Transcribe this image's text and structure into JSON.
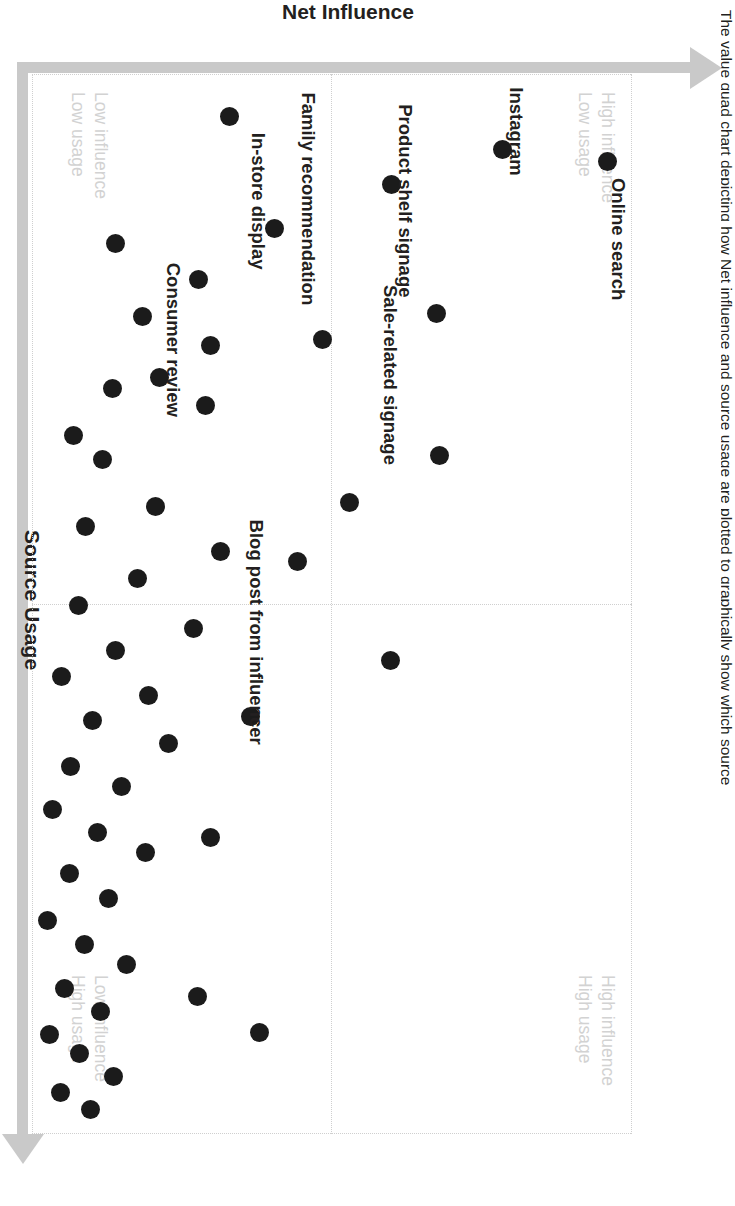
{
  "caption": "The value quad chart depicting how Net influence and source usage are plotted to graphically show which source",
  "axes": {
    "x_title": "Source Usage",
    "y_title": "Net Influence"
  },
  "quadrants": [
    {
      "id": "high-influence-low-usage",
      "line1": "High influence",
      "line2": "Low usage"
    },
    {
      "id": "high-influence-high-usage",
      "line1": "High influence",
      "line2": "High usage"
    },
    {
      "id": "low-influence-low-usage",
      "line1": "Low influence",
      "line2": "Low usage"
    },
    {
      "id": "low-influence-high-usage",
      "line1": "Low influence",
      "line2": "High usage"
    }
  ],
  "colors": {
    "dot": "#1b1b1b",
    "axis": "#c9c9c9",
    "grid": "#cfcfcf",
    "quadrant_label": "#d2d2d2",
    "text": "#231f20"
  },
  "chart_data": {
    "type": "scatter",
    "title": "The value quad chart depicting how Net influence and source usage are plotted to graphically show which source",
    "xlabel": "Source Usage",
    "ylabel": "Net Influence",
    "xlim": [
      0,
      100
    ],
    "ylim": [
      0,
      100
    ],
    "grid": true,
    "gridlines": {
      "x": [
        50
      ],
      "y": [
        50
      ]
    },
    "legend": "none",
    "quadrant_annotations": [
      {
        "position": "top-left",
        "text": "High influence / Low usage"
      },
      {
        "position": "top-right",
        "text": "High influence / High usage"
      },
      {
        "position": "bottom-left",
        "text": "Low influence / Low usage"
      },
      {
        "position": "bottom-right",
        "text": "Low influence / High usage"
      }
    ],
    "labeled_points": [
      {
        "label": "Online search",
        "x": 89,
        "y": 88
      },
      {
        "label": "Instagram",
        "x": 82,
        "y": 69
      },
      {
        "label": "Product shelf signage",
        "x": 78,
        "y": 60
      },
      {
        "label": "Sale-related signage",
        "x": 79,
        "y": 27
      },
      {
        "label": "Family recommendation",
        "x": 60,
        "y": 92
      },
      {
        "label": "In-store display",
        "x": 61,
        "y": 66
      },
      {
        "label": "Consumer review",
        "x": 50,
        "y": 37
      },
      {
        "label": "Blog post from influencer",
        "x": 21,
        "y": 47
      }
    ],
    "points": [
      {
        "x": 89,
        "y": 88
      },
      {
        "x": 82,
        "y": 69
      },
      {
        "x": 78,
        "y": 60
      },
      {
        "x": 79,
        "y": 27
      },
      {
        "x": 60,
        "y": 92
      },
      {
        "x": 61,
        "y": 66
      },
      {
        "x": 68,
        "y": 39
      },
      {
        "x": 50,
        "y": 37
      },
      {
        "x": 54,
        "y": 19
      },
      {
        "x": 51,
        "y": 52
      },
      {
        "x": 56,
        "y": 50
      },
      {
        "x": 46,
        "y": 43
      },
      {
        "x": 45,
        "y": 51
      },
      {
        "x": 44,
        "y": 56
      },
      {
        "x": 40,
        "y": 38
      },
      {
        "x": 38,
        "y": 62
      },
      {
        "x": 36,
        "y": 45
      },
      {
        "x": 34,
        "y": 21
      },
      {
        "x": 32,
        "y": 36
      },
      {
        "x": 31,
        "y": 58
      },
      {
        "x": 29,
        "y": 16
      },
      {
        "x": 28,
        "y": 43
      },
      {
        "x": 26,
        "y": 27
      },
      {
        "x": 25,
        "y": 52
      },
      {
        "x": 24,
        "y": 32
      },
      {
        "x": 22,
        "y": 21
      },
      {
        "x": 21,
        "y": 47
      },
      {
        "x": 19,
        "y": 37
      },
      {
        "x": 17,
        "y": 57
      },
      {
        "x": 16,
        "y": 28
      },
      {
        "x": 15,
        "y": 43
      },
      {
        "x": 14,
        "y": 12
      },
      {
        "x": 13,
        "y": 34
      },
      {
        "x": 12,
        "y": 48
      },
      {
        "x": 11,
        "y": 22
      },
      {
        "x": 10,
        "y": 40
      },
      {
        "x": 9,
        "y": 31
      },
      {
        "x": 9,
        "y": 36
      },
      {
        "x": 8,
        "y": 44
      },
      {
        "x": 7,
        "y": 26
      },
      {
        "x": 7,
        "y": 18
      },
      {
        "x": 6,
        "y": 33
      },
      {
        "x": 5,
        "y": 39
      },
      {
        "x": 5,
        "y": 29
      },
      {
        "x": 4,
        "y": 21
      },
      {
        "x": 4,
        "y": 35
      },
      {
        "x": 3,
        "y": 27
      },
      {
        "x": 3,
        "y": 31
      },
      {
        "x": 2,
        "y": 24
      },
      {
        "x": 2,
        "y": 37
      },
      {
        "x": 1,
        "y": 30
      },
      {
        "x": 1,
        "y": 14
      }
    ]
  },
  "rendered_dots": [
    {
      "l": 8.3,
      "t": 4.1
    },
    {
      "l": 7.1,
      "t": 21.6
    },
    {
      "l": 22.6,
      "t": 32.6
    },
    {
      "l": 10.4,
      "t": 40.0
    },
    {
      "l": 25.0,
      "t": 51.5
    },
    {
      "l": 4.0,
      "t": 67.1
    },
    {
      "l": 14.6,
      "t": 59.5
    },
    {
      "l": 19.4,
      "t": 72.2
    },
    {
      "l": 25.6,
      "t": 70.3
    },
    {
      "l": 31.3,
      "t": 71.0
    },
    {
      "l": 22.9,
      "t": 81.6
    },
    {
      "l": 28.6,
      "t": 78.8
    },
    {
      "l": 29.7,
      "t": 86.6
    },
    {
      "l": 16.0,
      "t": 86.0
    },
    {
      "l": 34.1,
      "t": 93.1
    },
    {
      "l": 36.4,
      "t": 88.3
    },
    {
      "l": 40.8,
      "t": 79.4
    },
    {
      "l": 42.7,
      "t": 91.0
    },
    {
      "l": 45.0,
      "t": 68.6
    },
    {
      "l": 47.6,
      "t": 82.4
    },
    {
      "l": 50.1,
      "t": 92.2
    },
    {
      "l": 52.3,
      "t": 73.0
    },
    {
      "l": 54.4,
      "t": 86.1
    },
    {
      "l": 56.8,
      "t": 95.1
    },
    {
      "l": 58.6,
      "t": 80.6
    },
    {
      "l": 61.0,
      "t": 89.9
    },
    {
      "l": 63.2,
      "t": 77.2
    },
    {
      "l": 65.3,
      "t": 93.6
    },
    {
      "l": 67.2,
      "t": 85.1
    },
    {
      "l": 69.4,
      "t": 96.5
    },
    {
      "l": 71.6,
      "t": 89.0
    },
    {
      "l": 73.4,
      "t": 81.1
    },
    {
      "l": 75.4,
      "t": 93.8
    },
    {
      "l": 77.8,
      "t": 87.3
    },
    {
      "l": 79.9,
      "t": 97.4
    },
    {
      "l": 82.1,
      "t": 91.3
    },
    {
      "l": 84.0,
      "t": 84.3
    },
    {
      "l": 86.3,
      "t": 94.5
    },
    {
      "l": 88.4,
      "t": 88.6
    },
    {
      "l": 90.6,
      "t": 97.0
    },
    {
      "l": 92.4,
      "t": 92.0
    },
    {
      "l": 94.6,
      "t": 86.4
    },
    {
      "l": 96.1,
      "t": 95.2
    },
    {
      "l": 97.7,
      "t": 90.2
    },
    {
      "l": 60.6,
      "t": 63.5
    },
    {
      "l": 72.0,
      "t": 70.3
    },
    {
      "l": 87.0,
      "t": 72.4
    },
    {
      "l": 90.4,
      "t": 62.0
    },
    {
      "l": 46.0,
      "t": 55.8
    },
    {
      "l": 40.4,
      "t": 47.0
    },
    {
      "l": 55.3,
      "t": 40.2
    },
    {
      "l": 36.0,
      "t": 32.0
    }
  ]
}
